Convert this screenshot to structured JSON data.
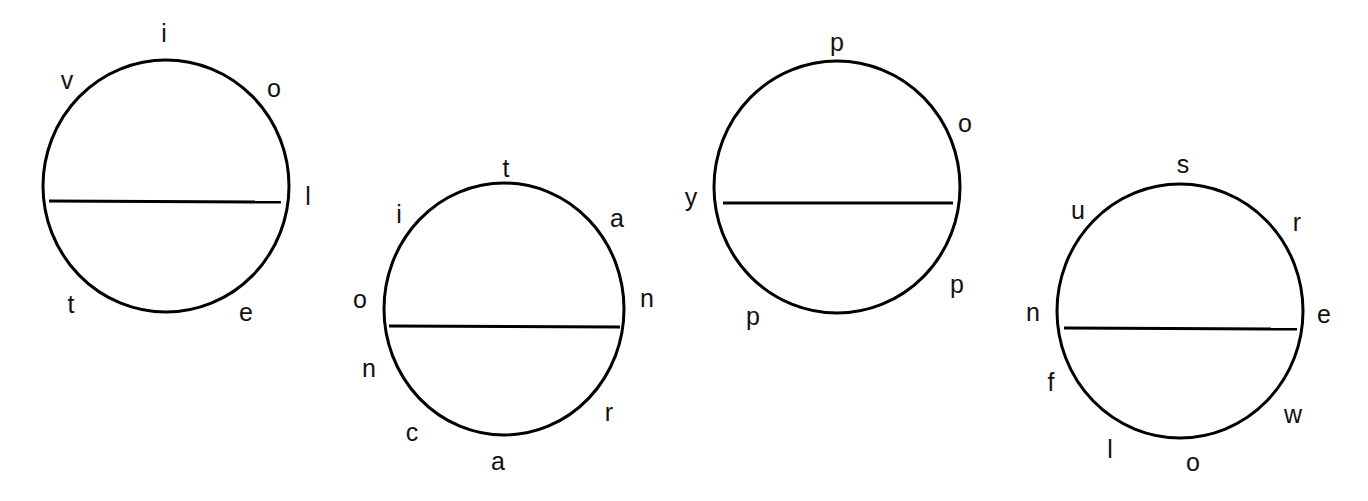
{
  "colors": {
    "background": "#ffffff",
    "stroke": "#000000",
    "text": "#111111"
  },
  "circles": [
    {
      "id": "circle-1",
      "cx": 166,
      "cy": 186,
      "rx": 123,
      "ry": 126,
      "divider": {
        "x1": 49,
        "y1": 201,
        "x2": 281,
        "y2": 202
      },
      "letters": [
        {
          "char": "i",
          "x": 164,
          "y": 33
        },
        {
          "char": "o",
          "x": 274,
          "y": 88
        },
        {
          "char": "l",
          "x": 308,
          "y": 196
        },
        {
          "char": "e",
          "x": 246,
          "y": 312
        },
        {
          "char": "t",
          "x": 71,
          "y": 304
        },
        {
          "char": "v",
          "x": 67,
          "y": 80
        }
      ]
    },
    {
      "id": "circle-2",
      "cx": 504,
      "cy": 309,
      "rx": 120,
      "ry": 126,
      "divider": {
        "x1": 389,
        "y1": 326,
        "x2": 620,
        "y2": 327
      },
      "letters": [
        {
          "char": "t",
          "x": 506,
          "y": 168
        },
        {
          "char": "a",
          "x": 617,
          "y": 218
        },
        {
          "char": "n",
          "x": 647,
          "y": 298
        },
        {
          "char": "r",
          "x": 609,
          "y": 412
        },
        {
          "char": "a",
          "x": 498,
          "y": 461
        },
        {
          "char": "c",
          "x": 412,
          "y": 432
        },
        {
          "char": "n",
          "x": 369,
          "y": 368
        },
        {
          "char": "o",
          "x": 360,
          "y": 299
        },
        {
          "char": "i",
          "x": 399,
          "y": 214
        }
      ]
    },
    {
      "id": "circle-3",
      "cx": 837,
      "cy": 187,
      "rx": 123,
      "ry": 126,
      "divider": {
        "x1": 723,
        "y1": 203,
        "x2": 953,
        "y2": 203
      },
      "letters": [
        {
          "char": "p",
          "x": 837,
          "y": 42
        },
        {
          "char": "o",
          "x": 965,
          "y": 123
        },
        {
          "char": "p",
          "x": 957,
          "y": 284
        },
        {
          "char": "p",
          "x": 753,
          "y": 316
        },
        {
          "char": "y",
          "x": 691,
          "y": 197
        }
      ]
    },
    {
      "id": "circle-4",
      "cx": 1180,
      "cy": 311,
      "rx": 123,
      "ry": 127,
      "divider": {
        "x1": 1064,
        "y1": 328,
        "x2": 1297,
        "y2": 329
      },
      "letters": [
        {
          "char": "s",
          "x": 1183,
          "y": 164
        },
        {
          "char": "r",
          "x": 1297,
          "y": 222
        },
        {
          "char": "e",
          "x": 1324,
          "y": 314
        },
        {
          "char": "w",
          "x": 1293,
          "y": 414
        },
        {
          "char": "o",
          "x": 1193,
          "y": 462
        },
        {
          "char": "l",
          "x": 1110,
          "y": 449
        },
        {
          "char": "f",
          "x": 1051,
          "y": 382
        },
        {
          "char": "n",
          "x": 1033,
          "y": 312
        },
        {
          "char": "u",
          "x": 1078,
          "y": 210
        }
      ]
    }
  ]
}
